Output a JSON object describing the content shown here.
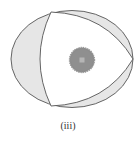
{
  "figure": {
    "caption": "(iii)",
    "colors": {
      "outline": "#555555",
      "shaded_region": "#e6e6e6",
      "background": "#ffffff",
      "gear": "#8c8c8c",
      "gear_center": "#b5b5b5"
    },
    "shapes": [
      {
        "name": "outer-ellipse",
        "type": "ellipse"
      },
      {
        "name": "reuleaux-triangle",
        "type": "curved triangle"
      },
      {
        "name": "central-gear",
        "type": "gear"
      }
    ]
  }
}
